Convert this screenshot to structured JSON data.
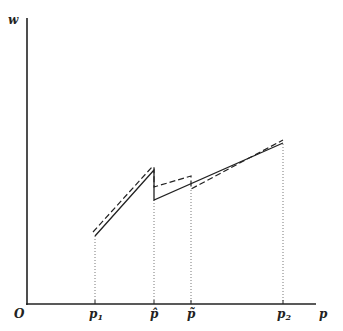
{
  "diagram": {
    "y_axis_label": "w",
    "x_axis_label": "p",
    "origin_label": "O",
    "ticks": [
      {
        "base": "p",
        "sub": "1",
        "x": 95
      },
      {
        "base": "p̂",
        "sub": "",
        "x": 154
      },
      {
        "base": "p̃",
        "sub": "",
        "x": 191
      },
      {
        "base": "p",
        "sub": "2",
        "x": 283
      }
    ],
    "colors": {
      "line": "#222222",
      "guide": "#555555"
    }
  }
}
